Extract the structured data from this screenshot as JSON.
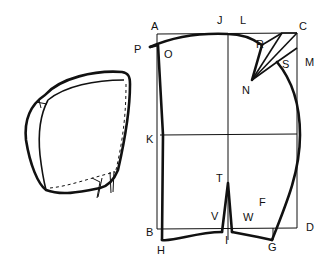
{
  "figure": {
    "labels": {
      "A": "A",
      "J": "J",
      "L": "L",
      "C": "C",
      "P": "P",
      "O": "O",
      "R": "R",
      "S": "S",
      "M": "M",
      "N": "N",
      "K": "K",
      "T": "T",
      "F": "F",
      "V": "V",
      "W": "W",
      "B": "B",
      "I": "I",
      "D": "D",
      "H": "H",
      "G": "G"
    }
  }
}
